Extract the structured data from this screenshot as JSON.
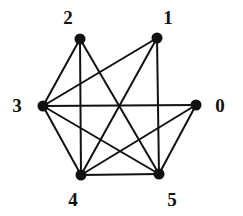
{
  "figure": {
    "kind": "undirected-graph-drawing",
    "width": 243,
    "height": 216,
    "background_color": "#ffffff",
    "edge_color": "#111111",
    "node_color": "#111111",
    "label_color": "#111111",
    "edge_width": 2,
    "node_radius": 5.5
  },
  "chart_data": {
    "type": "graph",
    "title": "",
    "directed": false,
    "weighted": false,
    "node_count": 6,
    "edge_count": 12,
    "nodes": [
      {
        "id": "0",
        "label": "0",
        "x": 196,
        "y": 105,
        "label_x": 220,
        "label_y": 105,
        "degree": 3
      },
      {
        "id": "1",
        "label": "1",
        "x": 157,
        "y": 38,
        "label_x": 168,
        "label_y": 17,
        "degree": 3
      },
      {
        "id": "2",
        "label": "2",
        "x": 80,
        "y": 39,
        "label_x": 68,
        "label_y": 17,
        "degree": 3
      },
      {
        "id": "3",
        "label": "3",
        "x": 43,
        "y": 106,
        "label_x": 17,
        "label_y": 105,
        "degree": 5
      },
      {
        "id": "4",
        "label": "4",
        "x": 81,
        "y": 175,
        "label_x": 73,
        "label_y": 199,
        "degree": 5
      },
      {
        "id": "5",
        "label": "5",
        "x": 159,
        "y": 174,
        "label_x": 172,
        "label_y": 199,
        "degree": 5
      }
    ],
    "edges": [
      {
        "source": "0",
        "target": "3"
      },
      {
        "source": "0",
        "target": "4"
      },
      {
        "source": "0",
        "target": "5"
      },
      {
        "source": "1",
        "target": "3"
      },
      {
        "source": "1",
        "target": "4"
      },
      {
        "source": "1",
        "target": "5"
      },
      {
        "source": "2",
        "target": "3"
      },
      {
        "source": "2",
        "target": "4"
      },
      {
        "source": "2",
        "target": "5"
      },
      {
        "source": "3",
        "target": "4"
      },
      {
        "source": "3",
        "target": "5"
      },
      {
        "source": "4",
        "target": "5"
      }
    ]
  }
}
